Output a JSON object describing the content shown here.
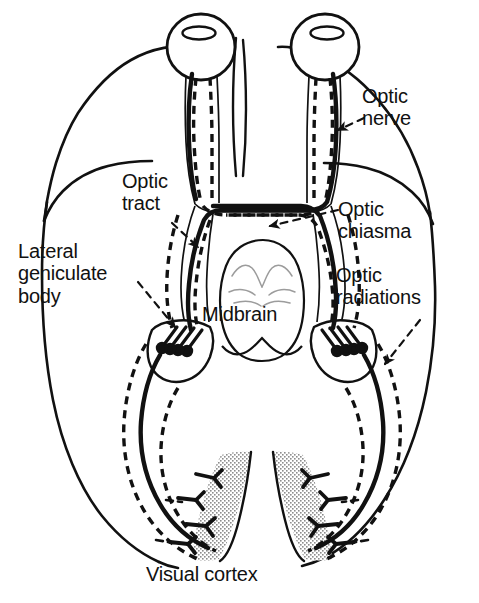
{
  "figure": {
    "type": "anatomical-diagram",
    "background_color": "#ffffff",
    "ink_color": "#111111",
    "stipple_color": "#9a9a9a"
  },
  "labels": {
    "optic_nerve": "Optic\nnerve",
    "optic_tract": "Optic\ntract",
    "optic_chiasma": "Optic\nchiasma",
    "lateral_geniculate_body": "Lateral\ngeniculate\nbody",
    "optic_radiations": "Optic\nradiations",
    "midbrain": "Midbrain",
    "visual_cortex": "Visual cortex"
  },
  "structures": [
    {
      "name": "left-eye",
      "kind": "eyeball",
      "side": "left"
    },
    {
      "name": "right-eye",
      "kind": "eyeball",
      "side": "right"
    },
    {
      "name": "optic-nerve-left",
      "kind": "nerve-bundle",
      "side": "left"
    },
    {
      "name": "optic-nerve-right",
      "kind": "nerve-bundle",
      "side": "right"
    },
    {
      "name": "optic-chiasma",
      "kind": "decussation"
    },
    {
      "name": "optic-tract-left",
      "kind": "tract",
      "side": "left"
    },
    {
      "name": "optic-tract-right",
      "kind": "tract",
      "side": "right"
    },
    {
      "name": "lateral-geniculate-body-left",
      "kind": "nucleus",
      "side": "left"
    },
    {
      "name": "lateral-geniculate-body-right",
      "kind": "nucleus",
      "side": "right"
    },
    {
      "name": "optic-radiation-left",
      "kind": "radiation",
      "side": "left"
    },
    {
      "name": "optic-radiation-right",
      "kind": "radiation",
      "side": "right"
    },
    {
      "name": "midbrain",
      "kind": "brainstem"
    },
    {
      "name": "visual-cortex-left",
      "kind": "cortex",
      "side": "left"
    },
    {
      "name": "visual-cortex-right",
      "kind": "cortex",
      "side": "right"
    },
    {
      "name": "brain-outline",
      "kind": "outline"
    }
  ],
  "line_styles": {
    "solid": "temporal (crossed) fibres drawn as heavy solid lines",
    "dashed": "nasal (uncrossed) fibres drawn as dashed lines"
  },
  "leaders": [
    {
      "name": "leader-optic-nerve",
      "from": "optic_nerve",
      "style": "dashed-with-arrowhead"
    },
    {
      "name": "leader-optic-tract",
      "from": "optic_tract",
      "style": "dashed-with-arrowhead"
    },
    {
      "name": "leader-optic-chiasma",
      "from": "optic_chiasma",
      "style": "dashed-with-arrowhead"
    },
    {
      "name": "leader-lgb",
      "from": "lateral_geniculate_body",
      "style": "dashed-with-arrowhead"
    },
    {
      "name": "leader-optic-radiations",
      "from": "optic_radiations",
      "style": "dashed-with-arrowhead"
    }
  ]
}
